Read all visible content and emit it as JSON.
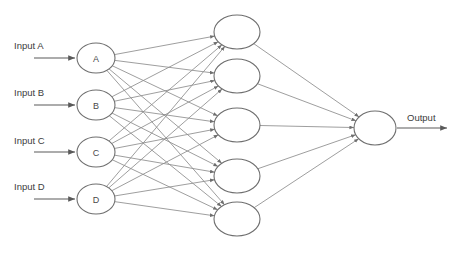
{
  "diagram": {
    "canvas": {
      "width": 455,
      "height": 254,
      "background": "#ffffff"
    },
    "style": {
      "node_stroke": "#6f6f6f",
      "node_fill": "#ffffff",
      "edge_color": "#8d8d8d",
      "arrow_color": "#5a5a5a",
      "text_color": "#3c3c3c"
    },
    "layers": [
      {
        "name": "input-layer",
        "kind": "input",
        "nodes": [
          {
            "id": "in-a",
            "label": "A",
            "input_label": "Input A",
            "cx": 96,
            "cy": 58,
            "rx": 19,
            "ry": 15
          },
          {
            "id": "in-b",
            "label": "B",
            "input_label": "Input B",
            "cx": 96,
            "cy": 105,
            "rx": 19,
            "ry": 15
          },
          {
            "id": "in-c",
            "label": "C",
            "input_label": "Input C",
            "cx": 96,
            "cy": 152,
            "rx": 19,
            "ry": 15
          },
          {
            "id": "in-d",
            "label": "D",
            "input_label": "Input D",
            "cx": 96,
            "cy": 199,
            "rx": 19,
            "ry": 15
          }
        ]
      },
      {
        "name": "hidden-layer",
        "kind": "hidden",
        "nodes": [
          {
            "id": "h1",
            "label": "",
            "cx": 237,
            "cy": 32,
            "rx": 23,
            "ry": 17
          },
          {
            "id": "h2",
            "label": "",
            "cx": 237,
            "cy": 76,
            "rx": 23,
            "ry": 17
          },
          {
            "id": "h3",
            "label": "",
            "cx": 237,
            "cy": 125,
            "rx": 23,
            "ry": 17
          },
          {
            "id": "h4",
            "label": "",
            "cx": 237,
            "cy": 176,
            "rx": 23,
            "ry": 17
          },
          {
            "id": "h5",
            "label": "",
            "cx": 237,
            "cy": 219,
            "rx": 23,
            "ry": 17
          }
        ]
      },
      {
        "name": "output-layer",
        "kind": "output",
        "nodes": [
          {
            "id": "out-1",
            "label": "",
            "output_label": "Output",
            "cx": 375,
            "cy": 128,
            "rx": 21,
            "ry": 17
          }
        ]
      }
    ],
    "edges": [
      {
        "from": "in-a",
        "to": "h1"
      },
      {
        "from": "in-a",
        "to": "h2"
      },
      {
        "from": "in-a",
        "to": "h3"
      },
      {
        "from": "in-a",
        "to": "h4"
      },
      {
        "from": "in-a",
        "to": "h5"
      },
      {
        "from": "in-b",
        "to": "h1"
      },
      {
        "from": "in-b",
        "to": "h2"
      },
      {
        "from": "in-b",
        "to": "h3"
      },
      {
        "from": "in-b",
        "to": "h4"
      },
      {
        "from": "in-b",
        "to": "h5"
      },
      {
        "from": "in-c",
        "to": "h1"
      },
      {
        "from": "in-c",
        "to": "h2"
      },
      {
        "from": "in-c",
        "to": "h3"
      },
      {
        "from": "in-c",
        "to": "h4"
      },
      {
        "from": "in-c",
        "to": "h5"
      },
      {
        "from": "in-d",
        "to": "h1"
      },
      {
        "from": "in-d",
        "to": "h2"
      },
      {
        "from": "in-d",
        "to": "h3"
      },
      {
        "from": "in-d",
        "to": "h4"
      },
      {
        "from": "in-d",
        "to": "h5"
      },
      {
        "from": "h1",
        "to": "out-1"
      },
      {
        "from": "h2",
        "to": "out-1"
      },
      {
        "from": "h3",
        "to": "out-1"
      },
      {
        "from": "h4",
        "to": "out-1"
      },
      {
        "from": "h5",
        "to": "out-1"
      }
    ],
    "input_arrows": [
      {
        "label": "Input A",
        "label_x": 14,
        "label_y": 45,
        "x1": 34,
        "y1": 58,
        "x2": 75,
        "y2": 58
      },
      {
        "label": "Input B",
        "label_x": 14,
        "label_y": 92,
        "x1": 34,
        "y1": 105,
        "x2": 75,
        "y2": 105
      },
      {
        "label": "Input C",
        "label_x": 14,
        "label_y": 140,
        "x1": 34,
        "y1": 152,
        "x2": 75,
        "y2": 152
      },
      {
        "label": "Input D",
        "label_x": 14,
        "label_y": 186,
        "x1": 34,
        "y1": 199,
        "x2": 75,
        "y2": 199
      }
    ],
    "output_arrow": {
      "label": "Output",
      "label_x": 407,
      "label_y": 117,
      "x1": 397,
      "y1": 128,
      "x2": 447,
      "y2": 128
    }
  }
}
